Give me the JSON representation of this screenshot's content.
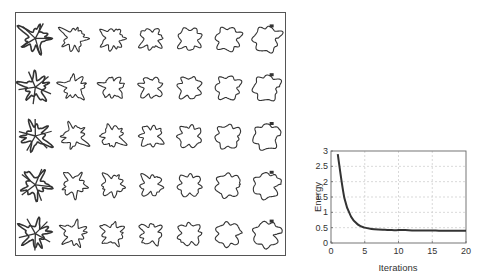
{
  "shape_grid": {
    "rows": 5,
    "cols": 7,
    "description": "Evolution of contour shapes across rows (different initializations) and columns (iterations); each column morphs from a spiky star-like shape to a rounded square then to a hooked final shape",
    "stroke_color": "#333333"
  },
  "chart_data": {
    "type": "line",
    "title": "",
    "xlabel": "Iterations",
    "ylabel": "Energy",
    "xlim": [
      0,
      20
    ],
    "ylim": [
      0,
      3
    ],
    "xticks": [
      0,
      5,
      10,
      15,
      20
    ],
    "yticks": [
      0,
      0.5,
      1,
      1.5,
      2,
      2.5,
      3
    ],
    "ytick_labels": [
      "0",
      "0.5",
      "1",
      "1.5",
      "2",
      "2.5",
      "3"
    ],
    "grid": true,
    "legend": null,
    "series": [
      {
        "name": "Energy",
        "color": "#333333",
        "x": [
          1,
          2,
          3,
          4,
          5,
          6,
          7,
          8,
          9,
          10,
          11,
          12,
          13,
          14,
          15,
          16,
          17,
          18,
          19,
          20
        ],
        "values": [
          2.9,
          1.45,
          0.85,
          0.6,
          0.5,
          0.46,
          0.44,
          0.43,
          0.42,
          0.42,
          0.42,
          0.41,
          0.41,
          0.41,
          0.41,
          0.4,
          0.4,
          0.4,
          0.4,
          0.4
        ]
      }
    ]
  }
}
